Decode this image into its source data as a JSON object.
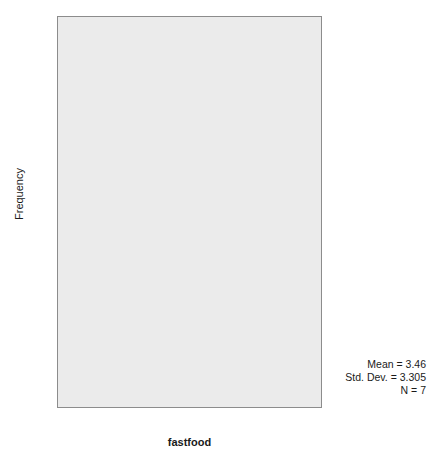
{
  "chart_data": {
    "type": "bar",
    "title": "",
    "subtitle": "",
    "xlabel": "fastfood",
    "ylabel": "Frequency",
    "xlim": [
      -1.0,
      13.0
    ],
    "ylim": [
      0,
      3.15
    ],
    "grid": false,
    "legend": null,
    "bin_width": 2,
    "categories": [
      "0-2",
      "2-4",
      "4-6",
      "6-8",
      "8-10",
      "10-12"
    ],
    "bin_starts": [
      0,
      2,
      4,
      6,
      8,
      10
    ],
    "values": [
      3,
      1,
      2,
      0,
      0,
      1
    ],
    "x_ticks": [
      0,
      2,
      4,
      6,
      8,
      10,
      12
    ],
    "x_tick_labels": [
      "0.00",
      "2.00",
      "4.00",
      "6.00",
      "8.00",
      "10.00",
      "12.00"
    ],
    "y_ticks": [
      0,
      1,
      2,
      3
    ],
    "y_tick_labels": [
      "0",
      "1",
      "2",
      "3"
    ],
    "annotations": [
      "Mean = 3.46",
      "Std. Dev. = 3.305",
      "N = 7"
    ],
    "colors": {
      "bar_fill": "#808080",
      "bar_edge": "#4f4f4f",
      "plot_background": "#ebebeb",
      "frame_border": "#8c8c8c",
      "figure_background": "#ffffff",
      "text": "#1a1a1a"
    }
  },
  "statistics": {
    "mean_text": "Mean = 3.46",
    "std_dev_text": "Std. Dev. = 3.305",
    "n_text": "N = 7"
  }
}
